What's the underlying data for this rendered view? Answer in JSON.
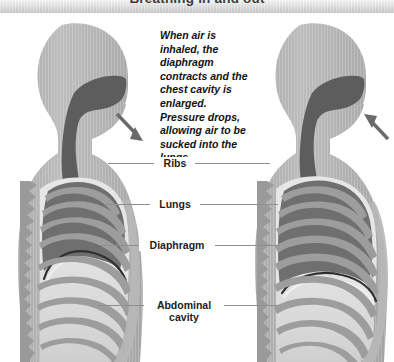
{
  "header": {
    "title": "Breathing in and out"
  },
  "caption": {
    "text": "When air is inhaled, the diaphragm contracts and the chest cavity is enlarged. Pressure drops, allowing air to be sucked into the lungs."
  },
  "labels": [
    {
      "id": "ribs",
      "text": "Ribs"
    },
    {
      "id": "lungs",
      "text": "Lungs"
    },
    {
      "id": "diaphragm",
      "text": "Diaphragm"
    },
    {
      "id": "abdominal-cavity",
      "text": "Abdominal cavity"
    }
  ],
  "figures": [
    {
      "id": "left-figure",
      "side": "left",
      "state": "exhaled",
      "arrow_direction": "out",
      "arrow_label": "air-flowing-out-arrow"
    },
    {
      "id": "right-figure",
      "side": "right",
      "state": "inhaled",
      "arrow_direction": "in",
      "arrow_label": "air-flowing-in-arrow"
    }
  ],
  "colors": {
    "body_fill": "#b5b5b5",
    "body_fill_light": "#c3c3c3",
    "airway": "#5d5d5d",
    "lung_dark": "#6f6f6f",
    "rib": "#8a8a8a",
    "abdomen": "#d9d9d9",
    "spine": "#9a9a9a",
    "arrow": "#6a6a6a",
    "leader_line": "#8f8f8f",
    "title_text": "#3d3d3d",
    "label_text": "#1d1d1d",
    "background": "#ffffff",
    "titlebar_top": "#f2f2f2",
    "titlebar_bottom": "#c4c4c4"
  }
}
